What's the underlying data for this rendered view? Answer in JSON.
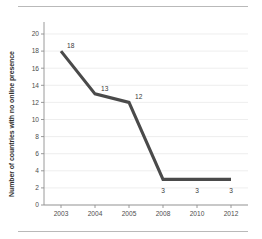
{
  "figure": {
    "background_color": "#ffffff",
    "rule_color": "#b9b9b9"
  },
  "chart_data": {
    "type": "line",
    "title": "",
    "subtitle": "",
    "xlabel": "",
    "ylabel": "Number of countries with no online presence",
    "categories": [
      "2003",
      "2004",
      "2005",
      "2008",
      "2010",
      "2012"
    ],
    "values": [
      18,
      13,
      12,
      3,
      3,
      3
    ],
    "data_labels": [
      "18",
      "13",
      "12",
      "3",
      "3",
      "3"
    ],
    "series": [
      {
        "name": "Number of countries with no online presence",
        "values": [
          18,
          13,
          12,
          3,
          3,
          3
        ],
        "color": "#4a4a4a"
      }
    ],
    "ylim": [
      0,
      20
    ],
    "yticks": [
      0,
      2,
      4,
      6,
      8,
      10,
      12,
      14,
      16,
      18,
      20
    ],
    "ytick_labels": [
      "0",
      "2",
      "4",
      "6",
      "8",
      "10",
      "12",
      "14",
      "16",
      "18",
      "20"
    ],
    "xtick_labels": [
      "2003",
      "2004",
      "2005",
      "2008",
      "2010",
      "2012"
    ],
    "grid": "horizontal",
    "gridline_color": "#e6e6e6",
    "axis_color": "#8f8f8f",
    "legend": "none",
    "legend_position": "none"
  }
}
